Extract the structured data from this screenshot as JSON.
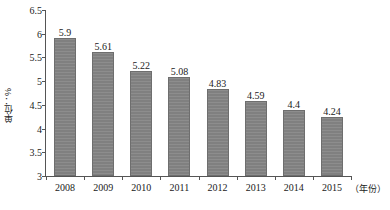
{
  "chart_data": {
    "type": "bar",
    "title": "",
    "subtitle": "",
    "xlabel": "（年份）",
    "ylabel": "单位：%",
    "categories": [
      "2008",
      "2009",
      "2010",
      "2011",
      "2012",
      "2013",
      "2014",
      "2015"
    ],
    "values": [
      5.9,
      5.61,
      5.22,
      5.08,
      4.83,
      4.59,
      4.4,
      4.24
    ],
    "value_labels": [
      "5.9",
      "5.61",
      "5.22",
      "5.08",
      "4.83",
      "4.59",
      "4.4",
      "4.24"
    ],
    "ylim": [
      3,
      6.5
    ],
    "yticks": [
      3,
      3.5,
      4,
      4.5,
      5,
      5.5,
      6,
      6.5
    ],
    "ytick_labels": [
      "3",
      "3.5",
      "4",
      "4.5",
      "5",
      "5.5",
      "6",
      "6.5"
    ],
    "grid": false,
    "legend": null,
    "legend_position": "none",
    "series": [
      {
        "name": "",
        "values": [
          5.9,
          5.61,
          5.22,
          5.08,
          4.83,
          4.59,
          4.4,
          4.24
        ],
        "color": "#808080"
      }
    ],
    "annotations": []
  },
  "colors": {
    "bar_fill": "#808080",
    "bar_stroke": "#6e6e6e",
    "axis": "#555555",
    "text": "#1a1a1a",
    "background": "#ffffff"
  }
}
